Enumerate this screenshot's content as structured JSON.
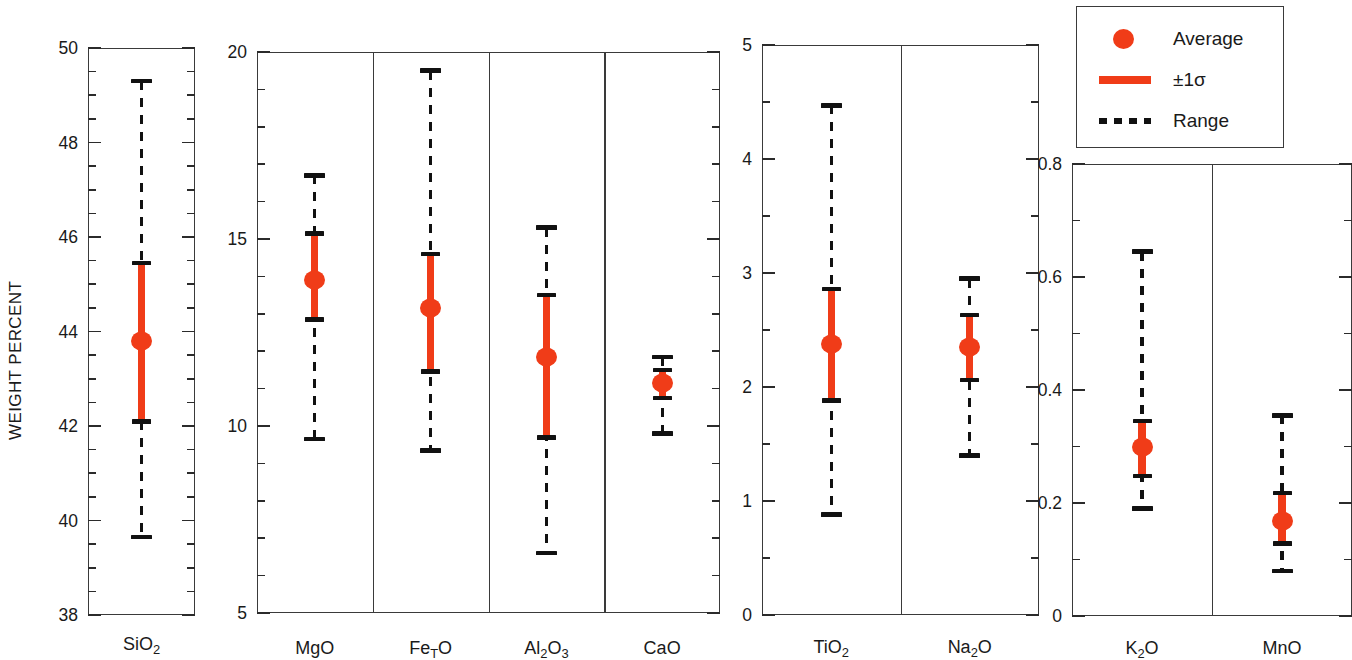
{
  "axis_title": "WEIGHT PERCENT",
  "colors": {
    "average": "#f03c18",
    "sigma": "#f03c18",
    "range": "#111111",
    "frame": "#3a3a3a"
  },
  "legend": {
    "items": [
      {
        "symbol": "filled-circle",
        "label": "Average"
      },
      {
        "symbol": "thick-bar",
        "label": "±1σ"
      },
      {
        "symbol": "dotted-line",
        "label": "Range"
      }
    ]
  },
  "chart_data": {
    "type": "scatter",
    "title": "",
    "subtitle": "",
    "xlabel": "",
    "ylabel": "WEIGHT PERCENT",
    "grid": false,
    "legend_position": "top-right",
    "notation": "Each oxide shows the average (red dot), ±1 standard deviation (red bar) and full observed range (dashed line with caps), in weight percent.",
    "panels": [
      {
        "id": "panel-sio2",
        "ylim": [
          38,
          50
        ],
        "major_ticks": [
          38,
          40,
          42,
          44,
          46,
          48,
          50
        ],
        "tick_labels": [
          "38",
          "40",
          "42",
          "44",
          "46",
          "48",
          "50"
        ],
        "minor_interval": 0.5,
        "label_side": "left",
        "series": [
          {
            "name": "SiO2",
            "label_html": "SiO<sub>2</sub>",
            "average": 43.8,
            "sigma_low": 42.1,
            "sigma_high": 45.45,
            "range_low": 39.65,
            "range_high": 49.3
          }
        ]
      },
      {
        "id": "panel-major-oxides",
        "ylim": [
          5,
          20
        ],
        "major_ticks": [
          5,
          10,
          15,
          20
        ],
        "tick_labels": [
          "5",
          "10",
          "15",
          "20"
        ],
        "minor_interval": 1,
        "label_side": "left",
        "series": [
          {
            "name": "MgO",
            "label_html": "MgO",
            "average": 13.9,
            "sigma_low": 12.85,
            "sigma_high": 15.15,
            "range_low": 9.65,
            "range_high": 16.7
          },
          {
            "name": "FeTO",
            "label_html": "Fe<sub>T</sub>O",
            "average": 13.15,
            "sigma_low": 11.45,
            "sigma_high": 14.6,
            "range_low": 9.35,
            "range_high": 19.5
          },
          {
            "name": "Al2O3",
            "label_html": "Al<sub>2</sub>O<sub>3</sub>",
            "average": 11.85,
            "sigma_low": 9.7,
            "sigma_high": 13.5,
            "range_low": 6.6,
            "range_high": 15.3
          },
          {
            "name": "CaO",
            "label_html": "CaO",
            "average": 11.15,
            "sigma_low": 10.75,
            "sigma_high": 11.5,
            "range_low": 9.8,
            "range_high": 11.85
          }
        ]
      },
      {
        "id": "panel-minor-oxides",
        "ylim": [
          0,
          5
        ],
        "major_ticks": [
          0,
          1,
          2,
          3,
          4,
          5
        ],
        "tick_labels": [
          "0",
          "1",
          "2",
          "3",
          "4",
          "5"
        ],
        "minor_interval": 0.5,
        "label_side": "left",
        "series": [
          {
            "name": "TiO2",
            "label_html": "TiO<sub>2</sub>",
            "average": 2.38,
            "sigma_low": 1.88,
            "sigma_high": 2.86,
            "range_low": 0.88,
            "range_high": 4.47
          },
          {
            "name": "Na2O",
            "label_html": "Na<sub>2</sub>O",
            "average": 2.35,
            "sigma_low": 2.06,
            "sigma_high": 2.63,
            "range_low": 1.4,
            "range_high": 2.95
          }
        ]
      },
      {
        "id": "panel-trace-oxides",
        "ylim": [
          0,
          0.8
        ],
        "major_ticks": [
          0,
          0.2,
          0.4,
          0.6,
          0.8
        ],
        "tick_labels": [
          "0",
          "0.2",
          "0.4",
          "0.6",
          "0.8"
        ],
        "minor_interval": 0.1,
        "label_side": "left",
        "series": [
          {
            "name": "K2O",
            "label_html": "K<sub>2</sub>O",
            "average": 0.3,
            "sigma_low": 0.248,
            "sigma_high": 0.345,
            "range_low": 0.19,
            "range_high": 0.645
          },
          {
            "name": "MnO",
            "label_html": "MnO",
            "average": 0.168,
            "sigma_low": 0.128,
            "sigma_high": 0.218,
            "range_low": 0.08,
            "range_high": 0.355
          }
        ]
      }
    ]
  },
  "layout": {
    "panel_boxes": [
      {
        "id": "panel-sio2",
        "x": 88,
        "y": 48,
        "w": 107,
        "h": 567,
        "label_y": 634
      },
      {
        "id": "panel-major-oxides",
        "x": 257,
        "y": 52,
        "w": 463,
        "h": 561,
        "label_y": 638
      },
      {
        "id": "panel-minor-oxides",
        "x": 762,
        "y": 45,
        "w": 277,
        "h": 570,
        "label_y": 637
      },
      {
        "id": "panel-trace-oxides",
        "x": 1072,
        "y": 164,
        "w": 280,
        "h": 452,
        "label_y": 638
      }
    ]
  }
}
